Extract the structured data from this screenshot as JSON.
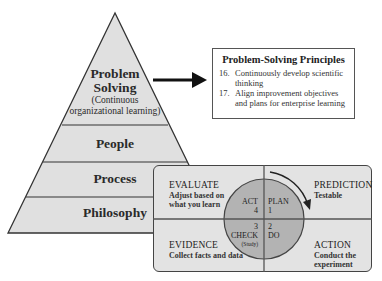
{
  "pyramid": {
    "layers": [
      {
        "title": "Problem",
        "title2": "Solving",
        "subtitle": "(Continuous",
        "subtitle2": "organizational learning)"
      },
      {
        "title": "People"
      },
      {
        "title": "Process"
      },
      {
        "title": "Philosophy"
      }
    ],
    "fill_color": "#e0e0e0",
    "stroke_color": "#333333"
  },
  "principles": {
    "title": "Problem-Solving Principles",
    "items": [
      {
        "number": "16.",
        "line1": "Continuously develop scientific",
        "line2": "thinking"
      },
      {
        "number": "17.",
        "line1": "Align improvement objectives",
        "line2": "and plans for enterprise learning"
      }
    ]
  },
  "pdca": {
    "quadrants": {
      "top_left": {
        "title": "EVALUATE",
        "line1": "Adjust based on",
        "line2": "what you learn"
      },
      "top_right": {
        "title": "PREDICTION",
        "line1": "Testable"
      },
      "bottom_left": {
        "title": "EVIDENCE",
        "line1": "Collect facts and data"
      },
      "bottom_right": {
        "title": "ACTION",
        "line1": "Conduct the",
        "line2": "experiment"
      }
    },
    "circle": {
      "act": {
        "label": "ACT",
        "number": "4"
      },
      "plan": {
        "label": "PLAN",
        "number": "1"
      },
      "check": {
        "label": "CHECK",
        "number": "3",
        "note": "(Study)"
      },
      "do": {
        "label": "DO",
        "number": "2"
      }
    },
    "circle_color": "#b3b3b3",
    "box_color": "#e3e3e3"
  }
}
